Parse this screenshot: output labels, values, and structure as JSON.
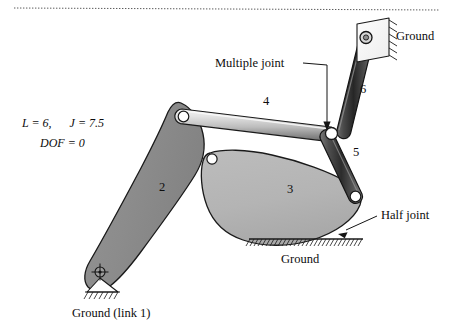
{
  "figure": {
    "type": "mechanism-linkage-diagram",
    "equation": {
      "line1_L": "L = 6,",
      "line1_J": "J = 7.5",
      "line2_DOF": "DOF = 0",
      "L_value": 6,
      "J_value": 7.5,
      "DOF_value": 0
    },
    "link_labels": {
      "link2": "2",
      "link3": "3",
      "link4": "4",
      "link5": "5",
      "link6": "6"
    },
    "annotations": {
      "multiple_joint": "Multiple joint",
      "half_joint": "Half joint",
      "ground_top_right": "Ground",
      "ground_bottom_middle": "Ground",
      "ground_link1": "Ground  (link 1)"
    },
    "colors": {
      "link2_fill": "#8e8e8e",
      "link3_fill": "#b6b6b6",
      "rod_light": "#e8e8e8",
      "rod_mid": "#9a9a9a",
      "rod_dark": "#3a3a3a",
      "outline": "#1a1a1a",
      "pin_fill": "#ffffff",
      "background": "#ffffff",
      "text": "#0d0d0d"
    }
  }
}
